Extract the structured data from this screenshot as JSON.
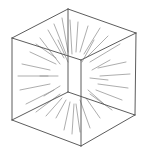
{
  "diagram": {
    "title": "",
    "colors": {
      "background": "#ffffff",
      "edge": "#4a4a4a",
      "vector": "#8a8a8a"
    },
    "center": [
      74,
      76
    ],
    "vertices": {
      "top": [
        68,
        9
      ],
      "left_top": [
        12,
        38
      ],
      "right_top": [
        136,
        33
      ],
      "front_top": [
        81,
        60
      ],
      "back_bottom": [
        68,
        92
      ],
      "left_bottom": [
        12,
        120
      ],
      "right_bottom": [
        135,
        115
      ],
      "front_bottom": [
        81,
        146
      ]
    },
    "edges": [
      [
        "top",
        "left_top"
      ],
      [
        "top",
        "right_top"
      ],
      [
        "left_top",
        "front_top"
      ],
      [
        "right_top",
        "front_top"
      ],
      [
        "top",
        "back_bottom"
      ],
      [
        "left_top",
        "left_bottom"
      ],
      [
        "right_top",
        "right_bottom"
      ],
      [
        "front_top",
        "front_bottom"
      ],
      [
        "left_bottom",
        "back_bottom"
      ],
      [
        "right_bottom",
        "back_bottom"
      ],
      [
        "left_bottom",
        "front_bottom"
      ],
      [
        "right_bottom",
        "front_bottom"
      ]
    ],
    "vectors": [
      [
        40,
        38,
        60,
        64
      ],
      [
        48,
        30,
        64,
        58
      ],
      [
        54,
        24,
        66,
        54
      ],
      [
        62,
        18,
        68,
        52
      ],
      [
        70,
        20,
        72,
        54
      ],
      [
        78,
        22,
        76,
        52
      ],
      [
        88,
        26,
        80,
        52
      ],
      [
        100,
        28,
        84,
        54
      ],
      [
        108,
        36,
        86,
        58
      ],
      [
        120,
        44,
        90,
        62
      ],
      [
        30,
        52,
        56,
        64
      ],
      [
        22,
        64,
        50,
        70
      ],
      [
        18,
        76,
        48,
        76
      ],
      [
        20,
        90,
        50,
        84
      ],
      [
        26,
        104,
        54,
        90
      ],
      [
        36,
        112,
        60,
        94
      ],
      [
        46,
        116,
        62,
        98
      ],
      [
        56,
        118,
        66,
        100
      ],
      [
        64,
        130,
        70,
        102
      ],
      [
        72,
        134,
        74,
        104
      ],
      [
        80,
        132,
        76,
        104
      ],
      [
        90,
        128,
        80,
        100
      ],
      [
        100,
        118,
        86,
        98
      ],
      [
        112,
        110,
        90,
        94
      ],
      [
        122,
        100,
        96,
        90
      ],
      [
        128,
        88,
        98,
        84
      ],
      [
        130,
        74,
        100,
        76
      ],
      [
        126,
        62,
        98,
        68
      ],
      [
        36,
        44,
        56,
        58
      ],
      [
        58,
        40,
        68,
        62
      ],
      [
        94,
        40,
        82,
        62
      ],
      [
        44,
        96,
        60,
        86
      ],
      [
        104,
        104,
        88,
        90
      ],
      [
        110,
        60,
        92,
        70
      ],
      [
        40,
        76,
        58,
        76
      ],
      [
        108,
        80,
        90,
        78
      ]
    ]
  }
}
